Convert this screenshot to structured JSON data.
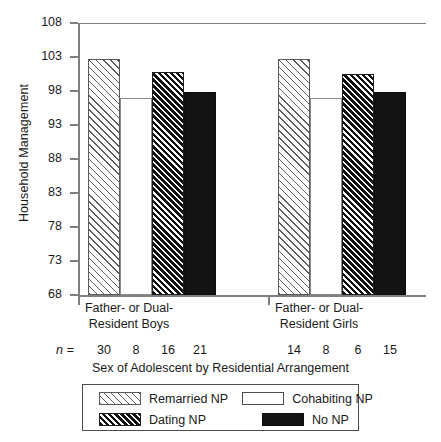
{
  "chart_data": {
    "type": "bar",
    "title": "",
    "xlabel": "Sex of Adolescent by Residential Arrangement",
    "ylabel": "Household Management",
    "ylim": [
      68,
      108
    ],
    "yticks": [
      68,
      73,
      78,
      83,
      88,
      93,
      98,
      103,
      108
    ],
    "grid": false,
    "legend_position": "bottom",
    "categories": [
      "Father- or Dual-Resident Boys",
      "Father- or Dual-Resident Girls"
    ],
    "category_lines": [
      [
        "Father- or Dual-",
        "Resident Boys"
      ],
      [
        "Father- or Dual-",
        "Resident Girls"
      ]
    ],
    "series": [
      {
        "name": "Remarried NP",
        "values": [
          102.7,
          102.7
        ],
        "n": [
          30,
          14
        ]
      },
      {
        "name": "Cohabiting NP",
        "values": [
          97.0,
          97.0
        ],
        "n": [
          8,
          8
        ]
      },
      {
        "name": "Dating NP",
        "values": [
          100.8,
          100.5
        ],
        "n": [
          16,
          6
        ]
      },
      {
        "name": "No NP",
        "values": [
          97.9,
          97.8
        ],
        "n": [
          21,
          15
        ]
      }
    ],
    "n_label": "n ="
  },
  "axis": {
    "y_title": "Household Management",
    "x_title": "Sex of Adolescent by Residential Arrangement",
    "y_tick_labels": [
      "108",
      "103",
      "98",
      "93",
      "88",
      "83",
      "78",
      "73",
      "68"
    ]
  },
  "groups": [
    {
      "line1": "Father- or Dual-",
      "line2": "Resident Boys",
      "n_values": [
        "30",
        "8",
        "16",
        "21"
      ]
    },
    {
      "line1": "Father- or Dual-",
      "line2": "Resident Girls",
      "n_values": [
        "14",
        "8",
        "6",
        "15"
      ]
    }
  ],
  "n_prefix": "n =",
  "legend": {
    "items": [
      {
        "label": "Remarried NP",
        "swatch": "diagonal-hatch-light"
      },
      {
        "label": "Cohabiting NP",
        "swatch": "empty-white"
      },
      {
        "label": "Dating NP",
        "swatch": "diagonal-hatch-dense"
      },
      {
        "label": "No NP",
        "swatch": "solid-black"
      }
    ]
  },
  "colors": {
    "axis": "#808080",
    "text": "#1a1a1a",
    "hatch_light": "#5d5d5d",
    "hatch_dense": "#111111",
    "solid_black": "#131313",
    "background": "#ffffff"
  }
}
